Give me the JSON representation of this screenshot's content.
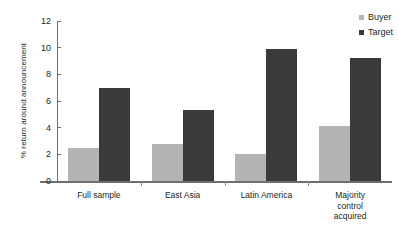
{
  "title_sliver": "Table 4.2. Abnormal returns",
  "legend": {
    "position": "top-right",
    "items": [
      {
        "label": "Buyer",
        "color": "#b4b4b4",
        "icon": "square-swatch-icon"
      },
      {
        "label": "Target",
        "color": "#3a3a3a",
        "icon": "square-swatch-icon"
      }
    ]
  },
  "axes": {
    "ylabel": "% return around announcement",
    "yticks": [
      "0",
      "2",
      "4",
      "6",
      "8",
      "10",
      "12"
    ],
    "xlabels": [
      [
        "Full sample"
      ],
      [
        "East Asia"
      ],
      [
        "Latin America"
      ],
      [
        "Majority",
        "control",
        "acquired"
      ]
    ]
  },
  "chart_data": {
    "type": "bar",
    "title": "",
    "xlabel": "",
    "ylabel": "% return around announcement",
    "ylim": [
      0,
      12
    ],
    "ytick_step": 2,
    "grid": false,
    "legend_position": "top-right",
    "categories": [
      "Full sample",
      "East Asia",
      "Latin America",
      "Majority control acquired"
    ],
    "series": [
      {
        "name": "Buyer",
        "color": "#b4b4b4",
        "values": [
          2.5,
          2.8,
          2.0,
          4.1
        ]
      },
      {
        "name": "Target",
        "color": "#3a3a3a",
        "values": [
          7.0,
          5.3,
          9.9,
          9.2
        ]
      }
    ]
  }
}
